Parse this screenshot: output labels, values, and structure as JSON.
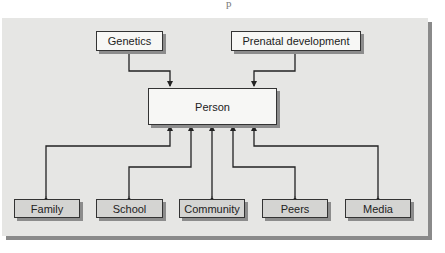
{
  "diagram": {
    "top_fragment": "p",
    "inputs": [
      {
        "id": "genetics",
        "label": "Genetics"
      },
      {
        "id": "prenatal",
        "label": "Prenatal development"
      }
    ],
    "center": {
      "id": "person",
      "label": "Person"
    },
    "contexts": [
      {
        "id": "family",
        "label": "Family"
      },
      {
        "id": "school",
        "label": "School"
      },
      {
        "id": "community",
        "label": "Community"
      },
      {
        "id": "peers",
        "label": "Peers"
      },
      {
        "id": "media",
        "label": "Media"
      }
    ],
    "edges": [
      {
        "from": "Genetics",
        "to": "Person",
        "direction": "one-way"
      },
      {
        "from": "Prenatal development",
        "to": "Person",
        "direction": "one-way"
      },
      {
        "from": "Family",
        "to": "Person",
        "direction": "two-way"
      },
      {
        "from": "School",
        "to": "Person",
        "direction": "two-way"
      },
      {
        "from": "Community",
        "to": "Person",
        "direction": "two-way"
      },
      {
        "from": "Peers",
        "to": "Person",
        "direction": "two-way"
      },
      {
        "from": "Media",
        "to": "Person",
        "direction": "two-way"
      }
    ],
    "colors": {
      "panel": "#e6e6e4",
      "panel_shadow": "#8a8a8a",
      "box_white": "#f7f7f5",
      "box_gray": "#d4d4d2",
      "line": "#222222"
    }
  }
}
